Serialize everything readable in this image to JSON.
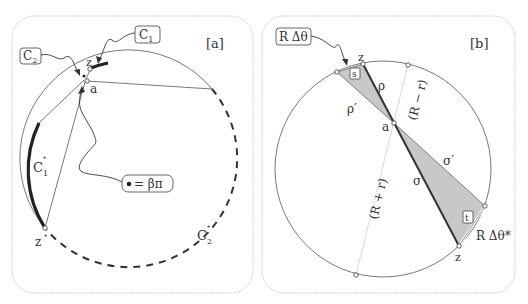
{
  "panels": [
    {
      "id": "a",
      "tag": "[a]",
      "labels": {
        "C1": "C",
        "C1_sub": "1",
        "C2": "C",
        "C2_sub": "2",
        "z": "z",
        "a": "a",
        "zstar": "z",
        "star": "⋆",
        "C1star": "C",
        "C1star_sub": "1",
        "C2star": "C",
        "C2star_sub": "2",
        "beta_pi": "= βπ"
      }
    },
    {
      "id": "b",
      "tag": "[b]",
      "labels": {
        "RDtheta": "R Δθ",
        "RDthetastar": "R Δθ*",
        "z_top": "z",
        "z_bottom": "z",
        "a": "a",
        "s": "s",
        "t": "t",
        "rho": "ρ",
        "rho_prime": "ρ′",
        "sigma": "σ",
        "sigma_prime": "σ′",
        "R_minus_r": "(R − r)",
        "R_plus_r": "(R + r)"
      }
    }
  ],
  "colors": {
    "panel_border": "#c8c8c8",
    "line": "#333333",
    "shade": "#c8c8c8",
    "thin": "#555555"
  }
}
